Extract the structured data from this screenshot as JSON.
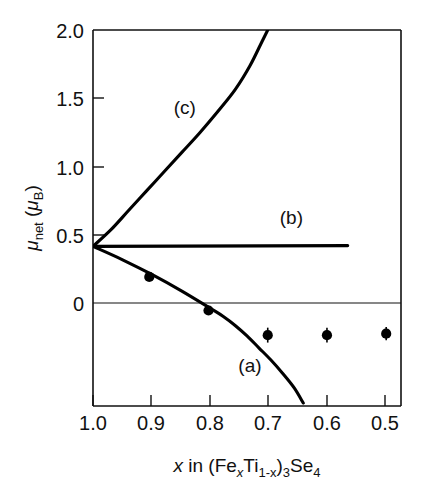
{
  "chart_data": {
    "type": "line",
    "title": "",
    "xlabel": "x in (FexTi1-x)3Se4",
    "ylabel": "μnet (μB)",
    "xlabel_parts": {
      "x_italic": "x",
      "in": " in (Fe",
      "sub_x": "x",
      "ti": "Ti",
      "sub_1mx": "1-x",
      "close": ")",
      "sub_3": "3",
      "se": "Se",
      "sub_4": "4"
    },
    "ylabel_parts": {
      "mu": "μ",
      "net": "net",
      "open": " (",
      "mu2": "μ",
      "b": "B",
      "close": ")"
    },
    "xlim": [
      1.0,
      0.48
    ],
    "ylim": [
      -0.52,
      2.0
    ],
    "x_reversed": true,
    "grid": false,
    "legend": "inline-curve-labels",
    "xticks": [
      1.0,
      0.9,
      0.8,
      0.7,
      0.6,
      0.5
    ],
    "xtick_labels": [
      "1.0",
      "0.9",
      "0.8",
      "0.7",
      "0.6",
      "0.5"
    ],
    "yticks": [
      2.0,
      1.5,
      1.0,
      0.5,
      0.0
    ],
    "ytick_labels": [
      "2.0",
      "1.5",
      "1.0",
      "0.5",
      "0"
    ],
    "common_origin": {
      "x": 1.0,
      "y": 0.55
    },
    "series": [
      {
        "name": "(a)",
        "label": "(a)",
        "label_at": {
          "x": 0.735,
          "y": -0.29
        },
        "style": "solid",
        "points": [
          {
            "x": 1.0,
            "y": 0.55
          },
          {
            "x": 0.95,
            "y": 0.46
          },
          {
            "x": 0.9,
            "y": 0.36
          },
          {
            "x": 0.85,
            "y": 0.25
          },
          {
            "x": 0.8,
            "y": 0.13
          },
          {
            "x": 0.78,
            "y": 0.08
          },
          {
            "x": 0.76,
            "y": 0.02
          },
          {
            "x": 0.74,
            "y": -0.05
          },
          {
            "x": 0.72,
            "y": -0.13
          },
          {
            "x": 0.7,
            "y": -0.21
          },
          {
            "x": 0.68,
            "y": -0.3
          },
          {
            "x": 0.66,
            "y": -0.4
          },
          {
            "x": 0.645,
            "y": -0.5
          }
        ]
      },
      {
        "name": "(b)",
        "label": "(b)",
        "label_at": {
          "x": 0.665,
          "y": 0.7
        },
        "style": "solid",
        "points": [
          {
            "x": 1.0,
            "y": 0.55
          },
          {
            "x": 0.57,
            "y": 0.555
          }
        ]
      },
      {
        "name": "(c)",
        "label": "(c)",
        "label_at": {
          "x": 0.845,
          "y": 1.44
        },
        "style": "solid",
        "points": [
          {
            "x": 1.0,
            "y": 0.55
          },
          {
            "x": 0.97,
            "y": 0.66
          },
          {
            "x": 0.94,
            "y": 0.79
          },
          {
            "x": 0.91,
            "y": 0.92
          },
          {
            "x": 0.88,
            "y": 1.05
          },
          {
            "x": 0.85,
            "y": 1.18
          },
          {
            "x": 0.82,
            "y": 1.31
          },
          {
            "x": 0.79,
            "y": 1.45
          },
          {
            "x": 0.76,
            "y": 1.6
          },
          {
            "x": 0.735,
            "y": 1.76
          },
          {
            "x": 0.715,
            "y": 1.92
          },
          {
            "x": 0.705,
            "y": 2.0
          }
        ]
      }
    ],
    "measured_points": {
      "name": "measured magnetic moment",
      "marker": "filled-circle",
      "values": [
        {
          "x": 0.905,
          "y": 0.345,
          "err": 0.0
        },
        {
          "x": 0.805,
          "y": 0.12,
          "err": 0.0
        },
        {
          "x": 0.705,
          "y": -0.045,
          "err": 0.05
        },
        {
          "x": 0.605,
          "y": -0.045,
          "err": 0.05
        },
        {
          "x": 0.505,
          "y": -0.035,
          "err": 0.045
        }
      ]
    }
  }
}
